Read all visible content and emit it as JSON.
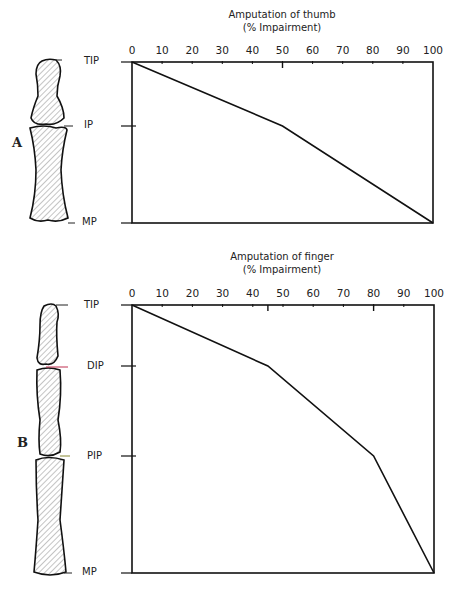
{
  "chart_data": [
    {
      "type": "line",
      "panel": "A",
      "title": "Amputation of thumb",
      "subtitle": "(% Impairment)",
      "xlabel": "% Impairment",
      "x_ticks": [
        0,
        10,
        20,
        30,
        40,
        50,
        60,
        70,
        80,
        90,
        100
      ],
      "xlim": [
        0,
        100
      ],
      "y_levels": [
        "TIP",
        "IP",
        "MP"
      ],
      "points": [
        {
          "level": "TIP",
          "impairment": 0
        },
        {
          "level": "IP",
          "impairment": 50
        },
        {
          "level": "MP",
          "impairment": 100
        }
      ],
      "grid": false
    },
    {
      "type": "line",
      "panel": "B",
      "title": "Amputation of finger",
      "subtitle": "(% Impairment)",
      "xlabel": "% Impairment",
      "x_ticks": [
        0,
        10,
        20,
        30,
        40,
        50,
        60,
        70,
        80,
        90,
        100
      ],
      "xlim": [
        0,
        100
      ],
      "y_levels": [
        "TIP",
        "DIP",
        "PIP",
        "MP"
      ],
      "points": [
        {
          "level": "TIP",
          "impairment": 0
        },
        {
          "level": "DIP",
          "impairment": 45
        },
        {
          "level": "PIP",
          "impairment": 80
        },
        {
          "level": "MP",
          "impairment": 100
        }
      ],
      "grid": false
    }
  ],
  "thumb": {
    "title": "Amputation of thumb",
    "subtitle": "(% Impairment)",
    "panel_label": "A",
    "joints": {
      "tip": "TIP",
      "ip": "IP",
      "mp": "MP"
    }
  },
  "finger": {
    "title": "Amputation of finger",
    "subtitle": "(% Impairment)",
    "panel_label": "B",
    "joints": {
      "tip": "TIP",
      "dip": "DIP",
      "pip": "PIP",
      "mp": "MP"
    }
  },
  "ticks": [
    "0",
    "10",
    "20",
    "30",
    "40",
    "50",
    "60",
    "70",
    "80",
    "90",
    "100"
  ]
}
